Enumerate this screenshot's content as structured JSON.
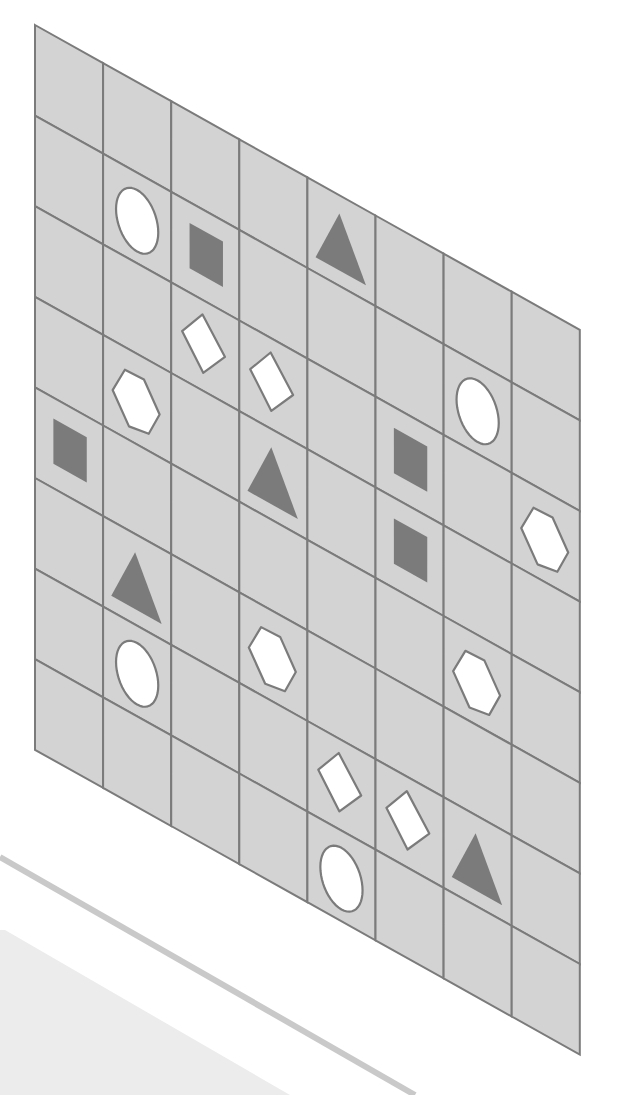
{
  "figure": {
    "type": "skewed-grid-puzzle",
    "grid": {
      "rows": 8,
      "cols": 8,
      "origin": [
        35,
        25
      ],
      "col_vector": [
        68.1,
        38.1
      ],
      "row_vector": [
        0,
        90.6
      ],
      "cell_fill": "#d3d3d3",
      "line_color": "#7b7b7b"
    },
    "colors": {
      "dark_shape": "#7b7b7b",
      "light_shape_fill": "#ffffff",
      "light_shape_stroke": "#7b7b7b",
      "stripe": "#c9c9c9",
      "lower_panel": "#ececec"
    },
    "shape_templates": {
      "circle": {
        "kind": "ellipse",
        "cx": 0.5,
        "cy": 0.53,
        "rx": 0.31,
        "ry": 0.34,
        "style": "light"
      },
      "square": {
        "kind": "polygon",
        "points": [
          [
            0.27,
            0.23
          ],
          [
            0.76,
            0.23
          ],
          [
            0.76,
            0.73
          ],
          [
            0.27,
            0.73
          ]
        ],
        "style": "dark"
      },
      "triangle": {
        "kind": "polygon",
        "points": [
          [
            0.47,
            0.2
          ],
          [
            0.86,
            0.83
          ],
          [
            0.12,
            0.83
          ]
        ],
        "style": "dark"
      },
      "hexagon": {
        "kind": "polygon",
        "points": [
          [
            0.32,
            0.25
          ],
          [
            0.6,
            0.24
          ],
          [
            0.83,
            0.53
          ],
          [
            0.67,
            0.81
          ],
          [
            0.38,
            0.85
          ],
          [
            0.14,
            0.55
          ]
        ],
        "style": "light"
      },
      "rectangle": {
        "kind": "polygon",
        "points": [
          [
            0.16,
            0.47
          ],
          [
            0.46,
            0.16
          ],
          [
            0.79,
            0.49
          ],
          [
            0.47,
            0.8
          ]
        ],
        "style": "light"
      }
    },
    "shapes": [
      {
        "type": "circle",
        "row": 1,
        "col": 1
      },
      {
        "type": "square",
        "row": 1,
        "col": 2
      },
      {
        "type": "triangle",
        "row": 0,
        "col": 4
      },
      {
        "type": "rectangle",
        "row": 2,
        "col": 2
      },
      {
        "type": "rectangle",
        "row": 2,
        "col": 3
      },
      {
        "type": "hexagon",
        "row": 3,
        "col": 1
      },
      {
        "type": "circle",
        "row": 1,
        "col": 6
      },
      {
        "type": "square",
        "row": 4,
        "col": 0
      },
      {
        "type": "triangle",
        "row": 3,
        "col": 3
      },
      {
        "type": "square",
        "row": 2,
        "col": 5
      },
      {
        "type": "square",
        "row": 3,
        "col": 5
      },
      {
        "type": "hexagon",
        "row": 2,
        "col": 7
      },
      {
        "type": "triangle",
        "row": 5,
        "col": 1
      },
      {
        "type": "circle",
        "row": 6,
        "col": 1
      },
      {
        "type": "hexagon",
        "row": 5,
        "col": 3
      },
      {
        "type": "hexagon",
        "row": 4,
        "col": 6
      },
      {
        "type": "rectangle",
        "row": 6,
        "col": 4
      },
      {
        "type": "rectangle",
        "row": 6,
        "col": 5
      },
      {
        "type": "circle",
        "row": 7,
        "col": 4
      },
      {
        "type": "triangle",
        "row": 6,
        "col": 6
      }
    ]
  },
  "cut_off_text": {
    "line1": "t",
    "line2": "l"
  }
}
